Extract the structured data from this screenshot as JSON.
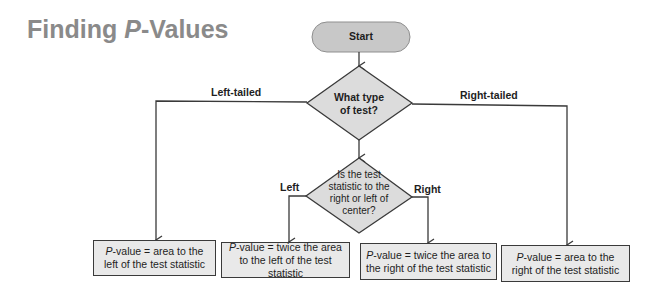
{
  "title": {
    "prefix": "Finding ",
    "italic": "P",
    "suffix": "-Values"
  },
  "colors": {
    "title": "#8a8a8a",
    "start_fill": "#c8c8c8",
    "decision_fill": "#dcdcdc",
    "result_fill": "#e9e9e9",
    "stroke": "#3a3a3a"
  },
  "nodes": {
    "start": {
      "label": "Start"
    },
    "decision_test_type": {
      "line1": "What type",
      "line2": "of test?"
    },
    "decision_center": {
      "line1": "Is the test",
      "line2": "statistic to the",
      "line3": "right or left of",
      "line4": "center?"
    }
  },
  "edges": {
    "left_tailed": "Left-tailed",
    "right_tailed": "Right-tailed",
    "left": "Left",
    "right": "Right"
  },
  "results": [
    {
      "italic": "P",
      "text": "-value = area to the left of the test statistic"
    },
    {
      "italic": "P",
      "text": "-value = twice the area to the left of the test statistic"
    },
    {
      "italic": "P",
      "text": "-value = twice the area to the right of the test statistic"
    },
    {
      "italic": "P",
      "text": "-value = area to the right of the test statistic"
    }
  ]
}
